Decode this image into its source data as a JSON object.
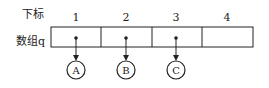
{
  "row_labels": {
    "index_label": "下标",
    "array_label": "数组q"
  },
  "indices": [
    "1",
    "2",
    "3",
    "4"
  ],
  "nodes": [
    "A",
    "B",
    "C"
  ],
  "colors": {
    "stroke": "#222222",
    "background": "#ffffff"
  }
}
